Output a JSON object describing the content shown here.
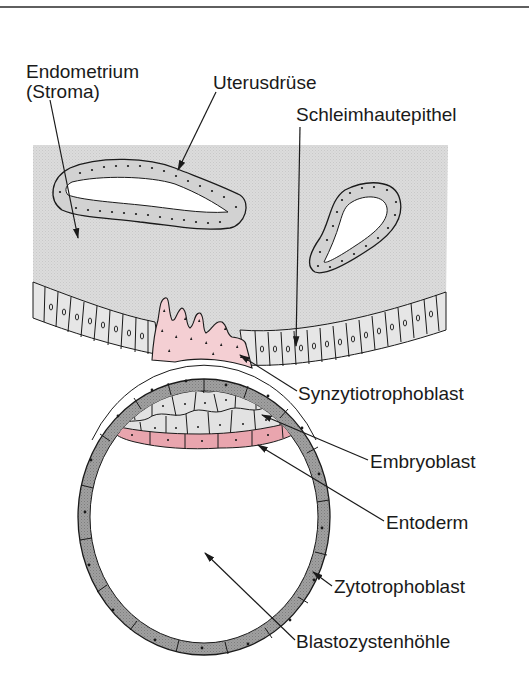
{
  "figure": {
    "top_rule": true,
    "colors": {
      "stroma": "#dcdcdc",
      "epithelium_cell": "#e6e6e6",
      "gland_cell": "#d6d6d6",
      "syncytium": "#f4cfd3",
      "syncytium_nucleus": "#1a1a1a",
      "cytotrophoblast": "#9a9a9a",
      "embryoblast_cell": "#e2e2e2",
      "entoderm": "#e9a5ae",
      "cavity": "#ffffff",
      "outline": "#1a1a1a"
    },
    "labels": {
      "endometrium_line1": "Endometrium",
      "endometrium_line2": "(Stroma)",
      "uterine_gland": "Uterusdrüse",
      "mucosal_epithelium": "Schleimhautepithel",
      "syncytiotrophoblast": "Synzytiotrophoblast",
      "embryoblast": "Embryoblast",
      "entoderm": "Entoderm",
      "cytotrophoblast": "Zytotrophoblast",
      "blastocyst_cavity": "Blastozystenhöhle"
    }
  }
}
